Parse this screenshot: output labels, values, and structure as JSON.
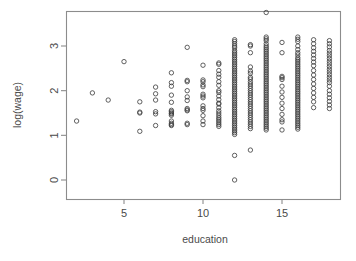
{
  "chart_data": {
    "type": "scatter",
    "title": "",
    "xlabel": "education",
    "ylabel": "log(wage)",
    "xlim": [
      1.2,
      18.6
    ],
    "ylim": [
      -0.15,
      3.9
    ],
    "xticks": [
      5,
      10,
      15
    ],
    "yticks": [
      0,
      1,
      2,
      3
    ],
    "xtick_labels": [
      "5",
      "10",
      "15"
    ],
    "ytick_labels": [
      "0",
      "1",
      "2",
      "3"
    ],
    "grid": false,
    "legend": null,
    "marker": {
      "shape": "open-circle",
      "radius_px": 2.2,
      "stroke": "#3a3a3a",
      "stroke_width": 0.8,
      "fill": "none"
    },
    "frame": {
      "box": true,
      "color": "#8c8c8c",
      "x_left_px": 66,
      "x_right_px": 340,
      "y_top_px": 11,
      "y_bottom_px": 199
    },
    "points": [
      [
        2,
        1.32
      ],
      [
        3,
        1.95
      ],
      [
        4,
        1.79
      ],
      [
        6,
        1.75
      ],
      [
        6,
        1.52
      ],
      [
        6,
        1.5
      ],
      [
        6,
        1.09
      ],
      [
        7,
        2.08
      ],
      [
        7,
        1.93
      ],
      [
        7,
        1.79
      ],
      [
        7,
        1.53
      ],
      [
        7,
        1.48
      ],
      [
        7,
        1.22
      ],
      [
        5,
        2.65
      ],
      [
        8,
        2.4
      ],
      [
        8,
        2.18
      ],
      [
        8,
        2.1
      ],
      [
        8,
        1.9
      ],
      [
        8,
        1.74
      ],
      [
        8,
        1.56
      ],
      [
        8,
        1.53
      ],
      [
        8,
        1.5
      ],
      [
        8,
        1.48
      ],
      [
        8,
        1.45
      ],
      [
        8,
        1.32
      ],
      [
        8,
        1.27
      ],
      [
        8,
        1.24
      ],
      [
        8,
        1.22
      ],
      [
        9,
        2.97
      ],
      [
        9,
        2.23
      ],
      [
        9,
        2.2
      ],
      [
        9,
        2.0
      ],
      [
        9,
        1.86
      ],
      [
        9,
        1.78
      ],
      [
        9,
        1.6
      ],
      [
        9,
        1.57
      ],
      [
        9,
        1.55
      ],
      [
        9,
        1.27
      ],
      [
        9,
        1.24
      ],
      [
        10,
        2.57
      ],
      [
        10,
        2.24
      ],
      [
        10,
        2.2
      ],
      [
        10,
        2.13
      ],
      [
        10,
        2.09
      ],
      [
        10,
        1.92
      ],
      [
        10,
        1.88
      ],
      [
        10,
        1.84
      ],
      [
        10,
        1.66
      ],
      [
        10,
        1.6
      ],
      [
        10,
        1.56
      ],
      [
        10,
        1.44
      ],
      [
        10,
        1.32
      ],
      [
        10,
        1.24
      ],
      [
        11,
        2.62
      ],
      [
        11,
        2.59
      ],
      [
        11,
        2.45
      ],
      [
        11,
        2.37
      ],
      [
        11,
        2.3
      ],
      [
        11,
        2.2
      ],
      [
        11,
        2.12
      ],
      [
        11,
        2.0
      ],
      [
        11,
        1.96
      ],
      [
        11,
        1.88
      ],
      [
        11,
        1.8
      ],
      [
        11,
        1.72
      ],
      [
        11,
        1.7
      ],
      [
        11,
        1.62
      ],
      [
        11,
        1.55
      ],
      [
        11,
        1.5
      ],
      [
        11,
        1.45
      ],
      [
        11,
        1.4
      ],
      [
        11,
        1.36
      ],
      [
        11,
        1.32
      ],
      [
        11,
        1.28
      ],
      [
        11,
        1.24
      ],
      [
        11,
        1.2
      ],
      [
        12,
        3.14
      ],
      [
        12,
        3.1
      ],
      [
        12,
        3.05
      ],
      [
        12,
        3.0
      ],
      [
        12,
        2.96
      ],
      [
        12,
        2.9
      ],
      [
        12,
        2.86
      ],
      [
        12,
        2.82
      ],
      [
        12,
        2.78
      ],
      [
        12,
        2.74
      ],
      [
        12,
        2.7
      ],
      [
        12,
        2.66
      ],
      [
        12,
        2.62
      ],
      [
        12,
        2.58
      ],
      [
        12,
        2.54
      ],
      [
        12,
        2.5
      ],
      [
        12,
        2.46
      ],
      [
        12,
        2.42
      ],
      [
        12,
        2.38
      ],
      [
        12,
        2.34
      ],
      [
        12,
        2.3
      ],
      [
        12,
        2.26
      ],
      [
        12,
        2.22
      ],
      [
        12,
        2.18
      ],
      [
        12,
        2.14
      ],
      [
        12,
        2.1
      ],
      [
        12,
        2.06
      ],
      [
        12,
        2.02
      ],
      [
        12,
        1.98
      ],
      [
        12,
        1.94
      ],
      [
        12,
        1.9
      ],
      [
        12,
        1.86
      ],
      [
        12,
        1.82
      ],
      [
        12,
        1.78
      ],
      [
        12,
        1.74
      ],
      [
        12,
        1.7
      ],
      [
        12,
        1.66
      ],
      [
        12,
        1.62
      ],
      [
        12,
        1.58
      ],
      [
        12,
        1.54
      ],
      [
        12,
        1.5
      ],
      [
        12,
        1.46
      ],
      [
        12,
        1.42
      ],
      [
        12,
        1.38
      ],
      [
        12,
        1.34
      ],
      [
        12,
        1.3
      ],
      [
        12,
        1.26
      ],
      [
        12,
        1.22
      ],
      [
        12,
        1.18
      ],
      [
        12,
        1.14
      ],
      [
        12,
        1.1
      ],
      [
        12,
        1.06
      ],
      [
        12,
        1.02
      ],
      [
        12,
        0.55
      ],
      [
        12,
        0.0
      ],
      [
        13,
        2.53
      ],
      [
        13,
        2.44
      ],
      [
        13,
        2.39
      ],
      [
        13,
        2.3
      ],
      [
        13,
        2.26
      ],
      [
        13,
        2.2
      ],
      [
        13,
        2.15
      ],
      [
        13,
        2.1
      ],
      [
        13,
        2.05
      ],
      [
        13,
        2.0
      ],
      [
        13,
        1.95
      ],
      [
        13,
        1.9
      ],
      [
        13,
        1.85
      ],
      [
        13,
        1.8
      ],
      [
        13,
        1.75
      ],
      [
        13,
        1.7
      ],
      [
        13,
        1.65
      ],
      [
        13,
        1.6
      ],
      [
        13,
        1.55
      ],
      [
        13,
        1.5
      ],
      [
        13,
        1.45
      ],
      [
        13,
        1.4
      ],
      [
        13,
        1.35
      ],
      [
        13,
        1.3
      ],
      [
        13,
        1.25
      ],
      [
        13,
        1.2
      ],
      [
        13,
        1.15
      ],
      [
        13,
        3.03
      ],
      [
        13,
        3.0
      ],
      [
        13,
        2.85
      ],
      [
        13,
        0.67
      ],
      [
        14,
        3.75
      ],
      [
        14,
        3.2
      ],
      [
        14,
        3.16
      ],
      [
        14,
        3.12
      ],
      [
        14,
        3.05
      ],
      [
        14,
        3.0
      ],
      [
        14,
        2.96
      ],
      [
        14,
        2.92
      ],
      [
        14,
        2.88
      ],
      [
        14,
        2.84
      ],
      [
        14,
        2.8
      ],
      [
        14,
        2.76
      ],
      [
        14,
        2.72
      ],
      [
        14,
        2.68
      ],
      [
        14,
        2.64
      ],
      [
        14,
        2.6
      ],
      [
        14,
        2.56
      ],
      [
        14,
        2.52
      ],
      [
        14,
        2.48
      ],
      [
        14,
        2.44
      ],
      [
        14,
        2.4
      ],
      [
        14,
        2.36
      ],
      [
        14,
        2.32
      ],
      [
        14,
        2.28
      ],
      [
        14,
        2.24
      ],
      [
        14,
        2.2
      ],
      [
        14,
        2.16
      ],
      [
        14,
        2.12
      ],
      [
        14,
        2.08
      ],
      [
        14,
        2.04
      ],
      [
        14,
        2.0
      ],
      [
        14,
        1.96
      ],
      [
        14,
        1.92
      ],
      [
        14,
        1.88
      ],
      [
        14,
        1.84
      ],
      [
        14,
        1.8
      ],
      [
        14,
        1.76
      ],
      [
        14,
        1.72
      ],
      [
        14,
        1.68
      ],
      [
        14,
        1.64
      ],
      [
        14,
        1.6
      ],
      [
        14,
        1.56
      ],
      [
        14,
        1.52
      ],
      [
        14,
        1.48
      ],
      [
        14,
        1.44
      ],
      [
        14,
        1.4
      ],
      [
        14,
        1.36
      ],
      [
        14,
        1.32
      ],
      [
        14,
        1.28
      ],
      [
        14,
        1.24
      ],
      [
        14,
        1.2
      ],
      [
        14,
        1.16
      ],
      [
        14,
        1.12
      ],
      [
        15,
        3.08
      ],
      [
        15,
        2.85
      ],
      [
        15,
        2.32
      ],
      [
        15,
        2.29
      ],
      [
        15,
        2.25
      ],
      [
        15,
        2.1
      ],
      [
        15,
        1.97
      ],
      [
        15,
        1.85
      ],
      [
        15,
        1.72
      ],
      [
        15,
        1.6
      ],
      [
        15,
        1.47
      ],
      [
        15,
        1.35
      ],
      [
        15,
        1.3
      ],
      [
        15,
        1.12
      ],
      [
        16,
        3.2
      ],
      [
        16,
        3.15
      ],
      [
        16,
        3.1
      ],
      [
        16,
        3.0
      ],
      [
        16,
        2.92
      ],
      [
        16,
        2.85
      ],
      [
        16,
        2.8
      ],
      [
        16,
        2.74
      ],
      [
        16,
        2.7
      ],
      [
        16,
        2.66
      ],
      [
        16,
        2.62
      ],
      [
        16,
        2.58
      ],
      [
        16,
        2.54
      ],
      [
        16,
        2.5
      ],
      [
        16,
        2.46
      ],
      [
        16,
        2.42
      ],
      [
        16,
        2.38
      ],
      [
        16,
        2.34
      ],
      [
        16,
        2.3
      ],
      [
        16,
        2.26
      ],
      [
        16,
        2.22
      ],
      [
        16,
        2.18
      ],
      [
        16,
        2.14
      ],
      [
        16,
        2.1
      ],
      [
        16,
        2.06
      ],
      [
        16,
        2.02
      ],
      [
        16,
        1.98
      ],
      [
        16,
        1.94
      ],
      [
        16,
        1.9
      ],
      [
        16,
        1.86
      ],
      [
        16,
        1.82
      ],
      [
        16,
        1.78
      ],
      [
        16,
        1.74
      ],
      [
        16,
        1.7
      ],
      [
        16,
        1.66
      ],
      [
        16,
        1.62
      ],
      [
        16,
        1.58
      ],
      [
        16,
        1.54
      ],
      [
        16,
        1.5
      ],
      [
        16,
        1.46
      ],
      [
        16,
        1.42
      ],
      [
        16,
        1.38
      ],
      [
        16,
        1.34
      ],
      [
        16,
        1.3
      ],
      [
        16,
        1.26
      ],
      [
        16,
        1.22
      ],
      [
        16,
        1.18
      ],
      [
        16,
        1.14
      ],
      [
        17,
        3.14
      ],
      [
        17,
        3.05
      ],
      [
        17,
        2.96
      ],
      [
        17,
        2.88
      ],
      [
        17,
        2.8
      ],
      [
        17,
        2.72
      ],
      [
        17,
        2.64
      ],
      [
        17,
        2.56
      ],
      [
        17,
        2.45
      ],
      [
        17,
        2.35
      ],
      [
        17,
        2.25
      ],
      [
        17,
        2.15
      ],
      [
        17,
        2.05
      ],
      [
        17,
        1.95
      ],
      [
        17,
        1.85
      ],
      [
        17,
        1.75
      ],
      [
        17,
        1.62
      ],
      [
        18,
        3.12
      ],
      [
        18,
        3.05
      ],
      [
        18,
        2.98
      ],
      [
        18,
        2.9
      ],
      [
        18,
        2.84
      ],
      [
        18,
        2.78
      ],
      [
        18,
        2.72
      ],
      [
        18,
        2.66
      ],
      [
        18,
        2.6
      ],
      [
        18,
        2.54
      ],
      [
        18,
        2.48
      ],
      [
        18,
        2.42
      ],
      [
        18,
        2.36
      ],
      [
        18,
        2.3
      ],
      [
        18,
        2.24
      ],
      [
        18,
        2.18
      ],
      [
        18,
        2.1
      ],
      [
        18,
        2.0
      ],
      [
        18,
        1.92
      ],
      [
        18,
        1.84
      ],
      [
        18,
        1.76
      ],
      [
        18,
        1.68
      ],
      [
        18,
        1.6
      ]
    ]
  }
}
